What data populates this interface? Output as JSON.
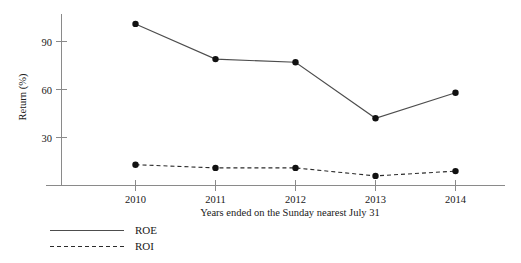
{
  "chart_data": {
    "type": "line",
    "title": "",
    "xlabel": "Years ended on the Sunday nearest July 31",
    "ylabel": "Return (%)",
    "categories": [
      "2010",
      "2011",
      "2012",
      "2013",
      "2014"
    ],
    "xtick_labels": [
      "2010",
      "2011",
      "2012",
      "2013",
      "2014"
    ],
    "ytick_labels": [
      "30",
      "60",
      "90"
    ],
    "yticks": [
      30,
      60,
      90
    ],
    "ylim": [
      0,
      110
    ],
    "grid": false,
    "legend_position": "bottom-left",
    "series": [
      {
        "name": "ROE",
        "style": "solid",
        "color": "#4d4d4d",
        "values": [
          101,
          79,
          77,
          42,
          58
        ]
      },
      {
        "name": "ROI",
        "style": "dashed",
        "color": "#2b2b2b",
        "values": [
          13,
          11,
          11,
          6,
          9
        ]
      }
    ]
  },
  "axes": {
    "y_title": "Return (%)",
    "x_title": "Years ended on the Sunday nearest July 31",
    "y_tick_0": "90",
    "y_tick_1": "60",
    "y_tick_2": "30",
    "x_tick_0": "2010",
    "x_tick_1": "2011",
    "x_tick_2": "2012",
    "x_tick_3": "2013",
    "x_tick_4": "2014"
  },
  "legend": {
    "entries": [
      {
        "label": "ROE",
        "style": "solid"
      },
      {
        "label": "ROI",
        "style": "dashed"
      }
    ],
    "entry_0_label": "ROE",
    "entry_1_label": "ROI"
  },
  "colors": {
    "roe_line": "#4d4d4d",
    "roi_line": "#2b2b2b",
    "axis": "#8a8a8a",
    "marker": "#111111",
    "background": "#ffffff"
  }
}
